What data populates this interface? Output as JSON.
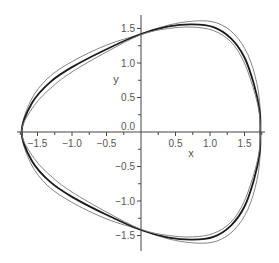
{
  "chart_data": {
    "type": "line",
    "title": "",
    "xlabel": "x",
    "ylabel": "y",
    "xlim": [
      -1.75,
      1.8
    ],
    "ylim": [
      -1.7,
      1.7
    ],
    "grid": false,
    "legend": null,
    "x_ticks": [
      -1.5,
      -1.0,
      -0.5,
      0.5,
      1.0,
      1.5
    ],
    "x_tick_labels": [
      "−1.5",
      "−1.0",
      "−0.5",
      "0.5",
      "1.0",
      "1.5"
    ],
    "y_ticks": [
      1.5,
      1.0,
      0.5,
      0.0,
      -0.5,
      -1.0,
      -1.5
    ],
    "y_tick_labels": [
      "1.5",
      "1.0",
      "0.5",
      "0.0",
      "−0.5",
      "−1.0",
      "−1.5"
    ],
    "series": [
      {
        "name": "outer orbit",
        "color": "#777777",
        "width": 0.9,
        "points": [
          [
            -1.73,
            0
          ],
          [
            -1.6,
            0.45
          ],
          [
            -1.35,
            0.78
          ],
          [
            -1.0,
            1.02
          ],
          [
            -0.5,
            1.26
          ],
          [
            0,
            1.42
          ],
          [
            0.4,
            1.55
          ],
          [
            0.8,
            1.61
          ],
          [
            1.1,
            1.58
          ],
          [
            1.35,
            1.42
          ],
          [
            1.55,
            1.12
          ],
          [
            1.68,
            0.7
          ],
          [
            1.73,
            0.3
          ],
          [
            1.73,
            0
          ],
          [
            1.73,
            -0.3
          ],
          [
            1.68,
            -0.7
          ],
          [
            1.55,
            -1.12
          ],
          [
            1.35,
            -1.42
          ],
          [
            1.1,
            -1.58
          ],
          [
            0.8,
            -1.61
          ],
          [
            0.4,
            -1.55
          ],
          [
            0,
            -1.42
          ],
          [
            -0.5,
            -1.26
          ],
          [
            -1.0,
            -1.02
          ],
          [
            -1.35,
            -0.78
          ],
          [
            -1.6,
            -0.45
          ],
          [
            -1.73,
            0
          ]
        ]
      },
      {
        "name": "middle orbit",
        "color": "#1a1a1a",
        "width": 1.8,
        "points": [
          [
            -1.73,
            0
          ],
          [
            -1.58,
            0.42
          ],
          [
            -1.32,
            0.72
          ],
          [
            -1.0,
            0.94
          ],
          [
            -0.5,
            1.2
          ],
          [
            0,
            1.42
          ],
          [
            0.4,
            1.53
          ],
          [
            0.75,
            1.56
          ],
          [
            1.05,
            1.52
          ],
          [
            1.3,
            1.36
          ],
          [
            1.5,
            1.08
          ],
          [
            1.64,
            0.68
          ],
          [
            1.72,
            0.3
          ],
          [
            1.73,
            0
          ],
          [
            1.72,
            -0.3
          ],
          [
            1.64,
            -0.68
          ],
          [
            1.5,
            -1.08
          ],
          [
            1.3,
            -1.36
          ],
          [
            1.05,
            -1.52
          ],
          [
            0.75,
            -1.56
          ],
          [
            0.4,
            -1.53
          ],
          [
            0,
            -1.42
          ],
          [
            -0.5,
            -1.2
          ],
          [
            -1.0,
            -0.94
          ],
          [
            -1.32,
            -0.72
          ],
          [
            -1.58,
            -0.42
          ],
          [
            -1.73,
            0
          ]
        ]
      },
      {
        "name": "inner orbit",
        "color": "#777777",
        "width": 0.9,
        "points": [
          [
            -1.73,
            0
          ],
          [
            -1.55,
            0.38
          ],
          [
            -1.28,
            0.66
          ],
          [
            -1.0,
            0.87
          ],
          [
            -0.5,
            1.16
          ],
          [
            0,
            1.41
          ],
          [
            0.4,
            1.5
          ],
          [
            0.75,
            1.52
          ],
          [
            1.05,
            1.47
          ],
          [
            1.3,
            1.31
          ],
          [
            1.48,
            1.04
          ],
          [
            1.62,
            0.66
          ],
          [
            1.71,
            0.3
          ],
          [
            1.73,
            0
          ],
          [
            1.71,
            -0.3
          ],
          [
            1.62,
            -0.66
          ],
          [
            1.48,
            -1.04
          ],
          [
            1.3,
            -1.31
          ],
          [
            1.05,
            -1.47
          ],
          [
            0.75,
            -1.52
          ],
          [
            0.4,
            -1.5
          ],
          [
            0,
            -1.41
          ],
          [
            -0.5,
            -1.16
          ],
          [
            -1.0,
            -0.87
          ],
          [
            -1.28,
            -0.66
          ],
          [
            -1.55,
            -0.38
          ],
          [
            -1.73,
            0
          ]
        ]
      }
    ]
  },
  "plot": {
    "origin_px": [
      141,
      132
    ],
    "scale_px": 69,
    "axis_color": "#444444"
  }
}
